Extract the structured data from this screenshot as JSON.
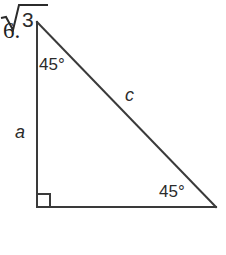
{
  "figure": {
    "problem_number": "6.",
    "background_color": "#ffffff",
    "stroke_color": "#3a3a3a",
    "text_color": "#2b2b2b",
    "stroke_width": 2,
    "vertices": {
      "apex": [
        37,
        22
      ],
      "right_angle": [
        37,
        207
      ],
      "bottom_right": [
        216,
        207
      ]
    },
    "right_angle_marker": {
      "present": true,
      "size": 12,
      "corner": "bottom-left"
    },
    "labels": {
      "angle_top": "45°",
      "angle_bottom_right": "45°",
      "leg_vertical": "a",
      "hypotenuse": "c",
      "leg_base_radicand": "3",
      "leg_base_full": "√3"
    }
  }
}
